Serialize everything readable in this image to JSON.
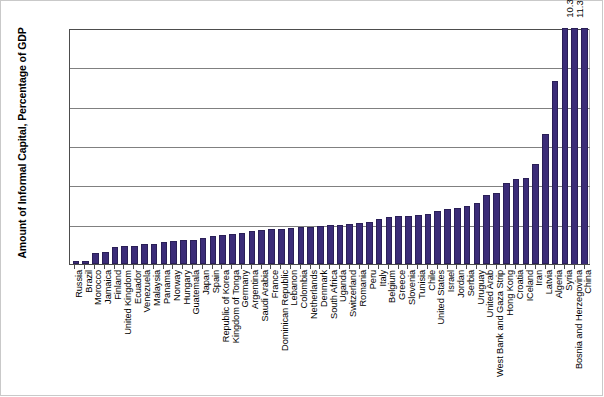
{
  "chart_data": {
    "type": "bar",
    "title": "",
    "xlabel": "",
    "ylabel": "Amount of Informal Capital, Percentage of GDP",
    "ylim": [
      0,
      6
    ],
    "ytick_labels": [
      "0%",
      "1%",
      "2%",
      "3%",
      "4%",
      "5%",
      "6%"
    ],
    "ytick_values": [
      0,
      1,
      2,
      3,
      4,
      5,
      6
    ],
    "grid": true,
    "legend": "none",
    "bar_color": "#3b2c78",
    "axis_color": "#4d4d4d",
    "gridline_color": "#808080",
    "note": "Final two bars exceed the 6% axis maximum and are clipped; their values are printed above the bars.",
    "categories": [
      "Russia",
      "Brazil",
      "Morocco",
      "Jamaica",
      "Finland",
      "United Kingdom",
      "Ecuador",
      "Venezuela",
      "Malaysia",
      "Panama",
      "Norway",
      "Hungary",
      "Guatemala",
      "Japan",
      "Spain",
      "Republic of Korea",
      "Kingdom of Tonga",
      "Germany",
      "Argentina",
      "Saudi Arabia",
      "France",
      "Dominican Republic",
      "Lebanon",
      "Colombia",
      "Netherlands",
      "Denmark",
      "South Africa",
      "Uganda",
      "Switzerland",
      "Romania",
      "Peru",
      "Italy",
      "Belgium",
      "Greece",
      "Slovenia",
      "Tunisia",
      "Chile",
      "United States",
      "Israel",
      "Jordan",
      "Serbia",
      "Uruguay",
      "United Arab",
      "West Bank and Gaza Strip",
      "Hong Kong",
      "Croatia",
      "ICeland",
      "Iran",
      "Latvia",
      "Algeria",
      "Syria",
      "Bosnia and Herzegovina",
      "China"
    ],
    "values": [
      0.08,
      0.08,
      0.28,
      0.3,
      0.43,
      0.45,
      0.47,
      0.5,
      0.52,
      0.55,
      0.58,
      0.6,
      0.62,
      0.66,
      0.7,
      0.73,
      0.76,
      0.8,
      0.83,
      0.86,
      0.88,
      0.9,
      0.92,
      0.94,
      0.95,
      0.97,
      0.98,
      1.0,
      1.02,
      1.04,
      1.06,
      1.15,
      1.2,
      1.22,
      1.23,
      1.25,
      1.26,
      1.35,
      1.4,
      1.42,
      1.48,
      1.55,
      1.75,
      1.8,
      2.05,
      2.15,
      2.18,
      2.55,
      3.3,
      4.65,
      6.0,
      10.3,
      11.3
    ],
    "value_labels": [
      "",
      "",
      "",
      "",
      "",
      "",
      "",
      "",
      "",
      "",
      "",
      "",
      "",
      "",
      "",
      "",
      "",
      "",
      "",
      "",
      "",
      "",
      "",
      "",
      "",
      "",
      "",
      "",
      "",
      "",
      "",
      "",
      "",
      "",
      "",
      "",
      "",
      "",
      "",
      "",
      "",
      "",
      "",
      "",
      "",
      "",
      "",
      "",
      "",
      "",
      "",
      "10.3",
      "11.3"
    ]
  }
}
